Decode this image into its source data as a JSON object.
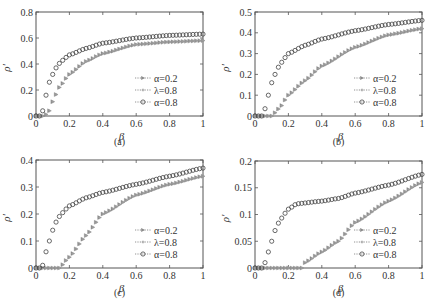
{
  "figure": {
    "panels": [
      "(a)",
      "(b)",
      "(c)",
      "(d)"
    ]
  },
  "legend": [
    {
      "label": "α=0.2",
      "marker": "triangle-right",
      "color": "#8a8a8a"
    },
    {
      "label": "λ=0.8",
      "marker": "plus",
      "color": "#9a9a9a"
    },
    {
      "label": "α=0.8",
      "marker": "circle-open",
      "color": "#444444"
    }
  ],
  "chart_data": [
    {
      "type": "scatter",
      "panel": "(a)",
      "xlabel": "β",
      "ylabel": "ρ'",
      "xlim": [
        0,
        1
      ],
      "ylim": [
        0,
        0.8
      ],
      "xticks": [
        0,
        0.2,
        0.4,
        0.6,
        0.8,
        1
      ],
      "xtick_labels": [
        "0",
        "0.2",
        "0.4",
        "0.6",
        "0.8",
        "1"
      ],
      "yticks": [
        0,
        0.2,
        0.4,
        0.6,
        0.8
      ],
      "ytick_labels": [
        "0",
        "0.2",
        "0.4",
        "0.6",
        "0.8"
      ],
      "legend_position": "lower right",
      "series": [
        {
          "name": "α=0.2",
          "knots": [
            [
              0,
              0
            ],
            [
              0.05,
              0
            ],
            [
              0.08,
              0.04
            ],
            [
              0.1,
              0.11
            ],
            [
              0.14,
              0.22
            ],
            [
              0.2,
              0.32
            ],
            [
              0.3,
              0.42
            ],
            [
              0.4,
              0.48
            ],
            [
              0.6,
              0.55
            ],
            [
              0.8,
              0.57
            ],
            [
              1,
              0.58
            ]
          ]
        },
        {
          "name": "λ=0.8",
          "knots": [
            [
              0,
              0
            ],
            [
              0.05,
              0
            ],
            [
              0.08,
              0.04
            ],
            [
              0.1,
              0.11
            ],
            [
              0.14,
              0.22
            ],
            [
              0.2,
              0.32
            ],
            [
              0.3,
              0.42
            ],
            [
              0.4,
              0.48
            ],
            [
              0.6,
              0.55
            ],
            [
              0.8,
              0.57
            ],
            [
              1,
              0.58
            ]
          ]
        },
        {
          "name": "α=0.8",
          "knots": [
            [
              0,
              0
            ],
            [
              0.02,
              0
            ],
            [
              0.04,
              0.04
            ],
            [
              0.06,
              0.16
            ],
            [
              0.08,
              0.26
            ],
            [
              0.1,
              0.32
            ],
            [
              0.12,
              0.37
            ],
            [
              0.15,
              0.42
            ],
            [
              0.2,
              0.47
            ],
            [
              0.3,
              0.52
            ],
            [
              0.4,
              0.56
            ],
            [
              0.6,
              0.6
            ],
            [
              0.8,
              0.62
            ],
            [
              1,
              0.63
            ]
          ]
        }
      ]
    },
    {
      "type": "scatter",
      "panel": "(b)",
      "xlabel": "β",
      "ylabel": "ρ'",
      "xlim": [
        0,
        1
      ],
      "ylim": [
        0,
        0.5
      ],
      "xticks": [
        0,
        0.2,
        0.4,
        0.6,
        0.8,
        1
      ],
      "xtick_labels": [
        "0",
        "0.2",
        "0.4",
        "0.6",
        "0.8",
        "1"
      ],
      "yticks": [
        0,
        0.1,
        0.2,
        0.3,
        0.4,
        0.5
      ],
      "ytick_labels": [
        "0",
        "0.1",
        "0.2",
        "0.3",
        "0.4",
        "0.5"
      ],
      "legend_position": "lower right",
      "series": [
        {
          "name": "α=0.2",
          "knots": [
            [
              0,
              0
            ],
            [
              0.1,
              0
            ],
            [
              0.15,
              0.04
            ],
            [
              0.2,
              0.1
            ],
            [
              0.3,
              0.17
            ],
            [
              0.4,
              0.24
            ],
            [
              0.6,
              0.33
            ],
            [
              0.8,
              0.39
            ],
            [
              1,
              0.42
            ]
          ]
        },
        {
          "name": "λ=0.8",
          "knots": [
            [
              0,
              0
            ],
            [
              0.1,
              0
            ],
            [
              0.15,
              0.04
            ],
            [
              0.2,
              0.1
            ],
            [
              0.3,
              0.17
            ],
            [
              0.4,
              0.24
            ],
            [
              0.6,
              0.33
            ],
            [
              0.8,
              0.39
            ],
            [
              1,
              0.42
            ]
          ]
        },
        {
          "name": "α=0.8",
          "knots": [
            [
              0,
              0
            ],
            [
              0.04,
              0
            ],
            [
              0.06,
              0.035
            ],
            [
              0.08,
              0.1
            ],
            [
              0.1,
              0.16
            ],
            [
              0.12,
              0.2
            ],
            [
              0.15,
              0.25
            ],
            [
              0.2,
              0.3
            ],
            [
              0.3,
              0.34
            ],
            [
              0.4,
              0.37
            ],
            [
              0.6,
              0.41
            ],
            [
              0.8,
              0.44
            ],
            [
              1,
              0.46
            ]
          ]
        }
      ]
    },
    {
      "type": "scatter",
      "panel": "(c)",
      "xlabel": "β",
      "ylabel": "ρ'",
      "xlim": [
        0,
        1
      ],
      "ylim": [
        0,
        0.4
      ],
      "xticks": [
        0,
        0.2,
        0.4,
        0.6,
        0.8,
        1
      ],
      "xtick_labels": [
        "0",
        "0.2",
        "0.4",
        "0.6",
        "0.8",
        "1"
      ],
      "yticks": [
        0,
        0.1,
        0.2,
        0.3,
        0.4
      ],
      "ytick_labels": [
        "0",
        "0.1",
        "0.2",
        "0.3",
        "0.4"
      ],
      "legend_position": "lower right",
      "series": [
        {
          "name": "α=0.2",
          "knots": [
            [
              0,
              0
            ],
            [
              0.14,
              0
            ],
            [
              0.2,
              0.04
            ],
            [
              0.3,
              0.12
            ],
            [
              0.4,
              0.2
            ],
            [
              0.6,
              0.27
            ],
            [
              0.8,
              0.31
            ],
            [
              1,
              0.34
            ]
          ]
        },
        {
          "name": "λ=0.8",
          "knots": [
            [
              0,
              0
            ],
            [
              0.14,
              0
            ],
            [
              0.2,
              0.04
            ],
            [
              0.3,
              0.12
            ],
            [
              0.4,
              0.2
            ],
            [
              0.6,
              0.27
            ],
            [
              0.8,
              0.31
            ],
            [
              1,
              0.34
            ]
          ]
        },
        {
          "name": "α=0.8",
          "knots": [
            [
              0,
              0
            ],
            [
              0.03,
              0
            ],
            [
              0.04,
              0.01
            ],
            [
              0.06,
              0.06
            ],
            [
              0.08,
              0.1
            ],
            [
              0.1,
              0.14
            ],
            [
              0.12,
              0.17
            ],
            [
              0.15,
              0.2
            ],
            [
              0.2,
              0.23
            ],
            [
              0.3,
              0.26
            ],
            [
              0.4,
              0.28
            ],
            [
              0.6,
              0.31
            ],
            [
              0.8,
              0.34
            ],
            [
              1,
              0.37
            ]
          ]
        }
      ]
    },
    {
      "type": "scatter",
      "panel": "(d)",
      "xlabel": "β",
      "ylabel": "ρ'",
      "xlim": [
        0,
        1
      ],
      "ylim": [
        0,
        0.2
      ],
      "xticks": [
        0,
        0.2,
        0.4,
        0.6,
        0.8,
        1
      ],
      "xtick_labels": [
        "0",
        "0.2",
        "0.4",
        "0.6",
        "0.8",
        "1"
      ],
      "yticks": [
        0,
        0.05,
        0.1,
        0.15,
        0.2
      ],
      "ytick_labels": [
        "0",
        "0.05",
        "0.1",
        "0.15",
        "0.2"
      ],
      "legend_position": "lower right",
      "series": [
        {
          "name": "α=0.2",
          "knots": [
            [
              0,
              0
            ],
            [
              0.28,
              0
            ],
            [
              0.3,
              0.01
            ],
            [
              0.4,
              0.03
            ],
            [
              0.5,
              0.05
            ],
            [
              0.6,
              0.085
            ],
            [
              0.8,
              0.125
            ],
            [
              1,
              0.16
            ]
          ]
        },
        {
          "name": "λ=0.8",
          "knots": [
            [
              0,
              0
            ],
            [
              0.28,
              0
            ],
            [
              0.3,
              0.01
            ],
            [
              0.4,
              0.03
            ],
            [
              0.5,
              0.05
            ],
            [
              0.6,
              0.085
            ],
            [
              0.8,
              0.125
            ],
            [
              1,
              0.16
            ]
          ]
        },
        {
          "name": "α=0.8",
          "knots": [
            [
              0,
              0
            ],
            [
              0.05,
              0
            ],
            [
              0.06,
              0.01
            ],
            [
              0.08,
              0.03
            ],
            [
              0.1,
              0.05
            ],
            [
              0.12,
              0.07
            ],
            [
              0.15,
              0.09
            ],
            [
              0.2,
              0.11
            ],
            [
              0.25,
              0.12
            ],
            [
              0.4,
              0.125
            ],
            [
              0.5,
              0.13
            ],
            [
              0.6,
              0.14
            ],
            [
              0.8,
              0.155
            ],
            [
              1,
              0.175
            ]
          ]
        }
      ]
    }
  ]
}
